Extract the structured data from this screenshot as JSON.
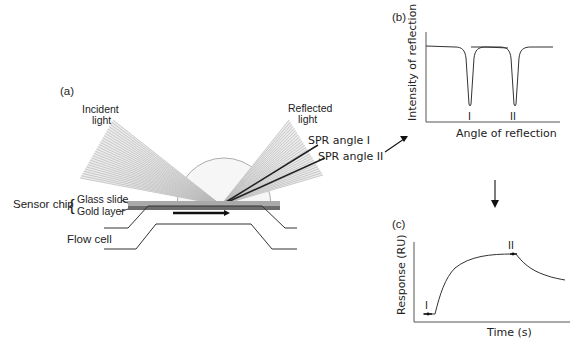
{
  "panels": {
    "a": {
      "tag": "(a)",
      "incident_light": [
        "Incident",
        "light"
      ],
      "reflected_light": [
        "Reflected",
        "light"
      ],
      "spr_angle_1": "SPR angle I",
      "spr_angle_2": "SPR angle II",
      "sensor_chip": "Sensor chip",
      "glass_slide": "Glass slide",
      "gold_layer": "Gold layer",
      "flow_cell": "Flow cell"
    },
    "b": {
      "tag": "(b)",
      "ylabel": "Intensity of reflection",
      "xlabel": "Angle of reflection",
      "dip_1": "I",
      "dip_2": "II"
    },
    "c": {
      "tag": "(c)",
      "ylabel": "Response (RU)",
      "xlabel": "Time (s)",
      "marker_1": "I",
      "marker_2": "II"
    }
  },
  "colors": {
    "light_fan": "#b8b8b8",
    "spr_ray": "#333333",
    "glass_slide": "#9a9a9a",
    "gold_layer": "#6f6f6f",
    "prism": "#f4f4f4"
  }
}
